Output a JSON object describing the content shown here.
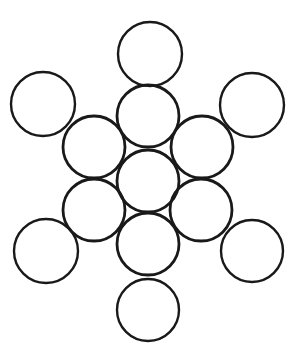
{
  "figure": {
    "background_color": "#ffffff",
    "stroke_color": "#191919",
    "stroke_width": 2.6,
    "fill": "none",
    "circle_count": 13,
    "canvas": {
      "width": 296,
      "height": 353
    }
  },
  "chart_data": {
    "type": "scatter",
    "subtitle": "",
    "xlabel": "",
    "ylabel": "",
    "xlim": [
      0,
      296
    ],
    "ylim": [
      0,
      353
    ],
    "grid": false,
    "legend": "none",
    "marker": "open-circle",
    "units": "pixels",
    "series": [
      {
        "name": "core",
        "values": [
          {
            "label": "center",
            "cx": 148,
            "cy": 181,
            "r": 31
          }
        ]
      },
      {
        "name": "inner-ring",
        "values": [
          {
            "label": "top",
            "cx": 148,
            "cy": 116,
            "r": 31
          },
          {
            "label": "upper-left",
            "cx": 94,
            "cy": 147,
            "r": 31
          },
          {
            "label": "upper-right",
            "cx": 202,
            "cy": 147,
            "r": 31
          },
          {
            "label": "lower-left",
            "cx": 94,
            "cy": 210,
            "r": 31
          },
          {
            "label": "lower-right",
            "cx": 201,
            "cy": 210,
            "r": 31
          },
          {
            "label": "bottom",
            "cx": 148,
            "cy": 244,
            "r": 31
          }
        ]
      },
      {
        "name": "outer-ring",
        "values": [
          {
            "label": "top-apex",
            "cx": 150,
            "cy": 54,
            "r": 32
          },
          {
            "label": "top-left",
            "cx": 43,
            "cy": 104,
            "r": 32
          },
          {
            "label": "top-right",
            "cx": 252,
            "cy": 105,
            "r": 32
          },
          {
            "label": "bottom-left",
            "cx": 46,
            "cy": 251,
            "r": 32
          },
          {
            "label": "bottom-right",
            "cx": 252,
            "cy": 251,
            "r": 31
          },
          {
            "label": "bottom-apex",
            "cx": 148,
            "cy": 310,
            "r": 31
          }
        ]
      }
    ]
  }
}
